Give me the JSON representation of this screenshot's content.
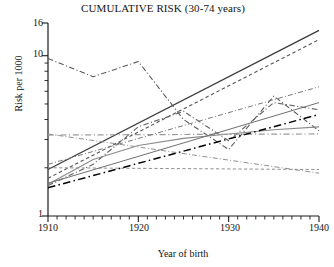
{
  "chart_data": {
    "type": "line",
    "title": "CUMULATIVE RISK (30-74 years)",
    "xlabel": "Year of birth",
    "ylabel": "Risk per 1000",
    "xlim": [
      1910,
      1940
    ],
    "ylim": [
      1,
      16
    ],
    "yscale": "log",
    "grid": false,
    "legend": "none",
    "xticks": [
      1910,
      1920,
      1930,
      1940
    ],
    "xtick_labels": [
      "1910",
      "1920",
      "1930",
      "1940"
    ],
    "xminor_tick_interval": 1,
    "yticks": [
      1,
      10,
      16
    ],
    "ytick_labels": [
      "1",
      "10",
      "16"
    ],
    "yminor_ticks": [
      2,
      3,
      4,
      5,
      6,
      7,
      8,
      9
    ],
    "series": [
      {
        "name": "series-1-solid-rising-steep",
        "style": "solid",
        "color": "#3c3c3c",
        "width": 1.3,
        "x": [
          1910,
          1940
        ],
        "y": [
          1.95,
          14.4
        ]
      },
      {
        "name": "series-2-dashed-rising-steep",
        "style": "dashed",
        "color": "#555555",
        "width": 1.1,
        "x": [
          1910,
          1940
        ],
        "y": [
          1.72,
          12.6
        ]
      },
      {
        "name": "series-3-dashdot-zigzag-high",
        "style": "dashdot",
        "color": "#5a5a5a",
        "width": 1.1,
        "x": [
          1910,
          1915,
          1920,
          1925,
          1930,
          1935,
          1940
        ],
        "y": [
          9.6,
          7.4,
          9.2,
          4.0,
          2.6,
          5.6,
          3.4
        ]
      },
      {
        "name": "series-4-dashdot-zigzag-rising",
        "style": "dashdot",
        "color": "#646464",
        "width": 1.1,
        "x": [
          1910,
          1915,
          1920,
          1925,
          1930,
          1935,
          1940
        ],
        "y": [
          1.55,
          2.1,
          3.6,
          4.5,
          2.95,
          5.1,
          4.6
        ]
      },
      {
        "name": "series-5-solid-gray-curve",
        "style": "solid",
        "color": "#8a8a8a",
        "width": 1.1,
        "x": [
          1910,
          1915,
          1920,
          1925,
          1930,
          1935,
          1940
        ],
        "y": [
          1.58,
          2.25,
          2.75,
          3.05,
          3.25,
          3.45,
          3.6
        ]
      },
      {
        "name": "series-6-dashdot-gray-flat",
        "style": "dashdot",
        "color": "#9a9a9a",
        "width": 1.2,
        "x": [
          1910,
          1940
        ],
        "y": [
          3.2,
          3.25
        ]
      },
      {
        "name": "series-7-dashed-gray-flat-low",
        "style": "dashed",
        "color": "#8f8f8f",
        "width": 1.0,
        "x": [
          1910,
          1940
        ],
        "y": [
          2.0,
          1.95
        ]
      },
      {
        "name": "series-8-black-dashdot-rising",
        "style": "dashdot",
        "color": "#000000",
        "width": 1.5,
        "x": [
          1910,
          1940
        ],
        "y": [
          1.5,
          4.3
        ]
      },
      {
        "name": "series-9-gray-dashdot-descending",
        "style": "dashdot",
        "color": "#909090",
        "width": 1.0,
        "x": [
          1910,
          1940
        ],
        "y": [
          3.25,
          1.85
        ]
      },
      {
        "name": "series-10-gray-rising-mid",
        "style": "solid",
        "color": "#707070",
        "width": 1.0,
        "x": [
          1910,
          1940
        ],
        "y": [
          1.6,
          5.1
        ]
      },
      {
        "name": "series-11-gray-dashdot-crossing",
        "style": "dashdot",
        "color": "#7a7a7a",
        "width": 1.0,
        "x": [
          1910,
          1940
        ],
        "y": [
          2.1,
          6.4
        ]
      }
    ]
  },
  "axis": {
    "title": "CUMULATIVE RISK (30-74 years)",
    "ylabel": "Risk per 1000",
    "xlabel": "Year of birth",
    "ytick_16": "16",
    "ytick_10": "10",
    "ytick_1": "1",
    "xtick_1910": "1910",
    "xtick_1920": "1920",
    "xtick_1930": "1930",
    "xtick_1940": "1940"
  }
}
